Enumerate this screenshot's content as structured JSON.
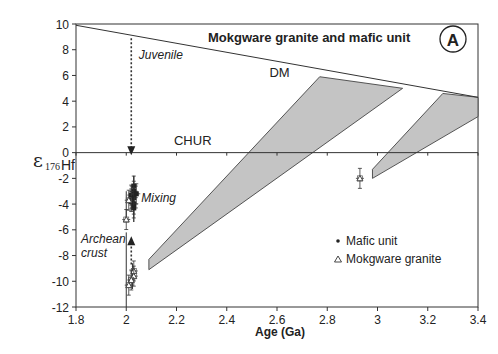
{
  "chart_data": {
    "type": "scatter",
    "title": "Mokgware granite and mafic unit",
    "panel_label": "A",
    "xlabel": "Age (Ga)",
    "ylabel": "ε176Hf",
    "xlim": [
      1.8,
      3.4
    ],
    "ylim": [
      -12,
      10
    ],
    "xticks": [
      1.8,
      2.0,
      2.2,
      2.4,
      2.6,
      2.8,
      3.0,
      3.2,
      3.4
    ],
    "xtick_labels": [
      "1.8",
      "2",
      "2.2",
      "2.4",
      "2.6",
      "2.8",
      "3",
      "3.2",
      "3.4"
    ],
    "yticks": [
      10,
      8,
      6,
      4,
      2,
      0,
      -2,
      -4,
      -6,
      -8,
      -10,
      -12
    ],
    "ytick_labels": [
      "10",
      "8",
      "6",
      "4",
      "2",
      "0",
      "-2",
      "-4",
      "-6",
      "-8",
      "-10",
      "-12"
    ],
    "grid": false,
    "legend_position": "lower right",
    "legend": [
      {
        "marker": "•",
        "label": "Mafic unit"
      },
      {
        "marker": "△",
        "label": "Mokgware granite"
      }
    ],
    "reference_lines": [
      {
        "name": "DM",
        "x": [
          1.8,
          3.4
        ],
        "y": [
          9.9,
          4.3
        ]
      },
      {
        "name": "CHUR",
        "x": [
          1.8,
          3.4
        ],
        "y": [
          0,
          0
        ]
      }
    ],
    "evolution_bands": [
      {
        "name": "band-1",
        "polygon": [
          [
            2.09,
            -8.3
          ],
          [
            2.77,
            5.9
          ],
          [
            3.1,
            5.0
          ],
          [
            2.09,
            -9.1
          ]
        ]
      },
      {
        "name": "band-2",
        "polygon": [
          [
            2.98,
            -1.3
          ],
          [
            3.26,
            4.6
          ],
          [
            3.4,
            4.3
          ],
          [
            3.4,
            2.8
          ],
          [
            2.98,
            -2.0
          ]
        ]
      }
    ],
    "series": [
      {
        "name": "Mafic unit",
        "points": [
          {
            "x": 2.03,
            "y": -2.6
          },
          {
            "x": 2.03,
            "y": -3.0
          },
          {
            "x": 2.02,
            "y": -3.3
          },
          {
            "x": 2.03,
            "y": -3.5
          },
          {
            "x": 2.02,
            "y": -3.8
          },
          {
            "x": 2.03,
            "y": -4.0
          },
          {
            "x": 2.03,
            "y": -4.3
          },
          {
            "x": 2.02,
            "y": -3.6
          },
          {
            "x": 2.04,
            "y": -3.2
          }
        ]
      },
      {
        "name": "Mokgware granite",
        "points": [
          {
            "x": 2.0,
            "y": -5.2
          },
          {
            "x": 2.01,
            "y": -3.7
          },
          {
            "x": 2.03,
            "y": -9.2
          },
          {
            "x": 2.03,
            "y": -9.6
          },
          {
            "x": 2.02,
            "y": -9.9
          },
          {
            "x": 2.01,
            "y": -10.3
          },
          {
            "x": 2.93,
            "y": -2.0
          }
        ]
      }
    ],
    "annotations": [
      {
        "text": "Juvenile",
        "x": 2.05,
        "y": 7.3
      },
      {
        "text": "DM",
        "x": 2.57,
        "y": 5.9
      },
      {
        "text": "CHUR",
        "x": 2.19,
        "y": 0.6
      },
      {
        "text": "Mixing",
        "x": 2.06,
        "y": -3.8
      },
      {
        "text": "Archean",
        "x": 1.82,
        "y": -7.0
      },
      {
        "text": "crust",
        "x": 1.82,
        "y": -8.1
      }
    ],
    "arrows": [
      {
        "from": [
          2.02,
          8.9
        ],
        "to": [
          2.02,
          -0.2
        ],
        "style": "dotted"
      },
      {
        "from": [
          2.02,
          -8.7
        ],
        "to": [
          2.02,
          -6.5
        ],
        "style": "dotted"
      }
    ]
  }
}
